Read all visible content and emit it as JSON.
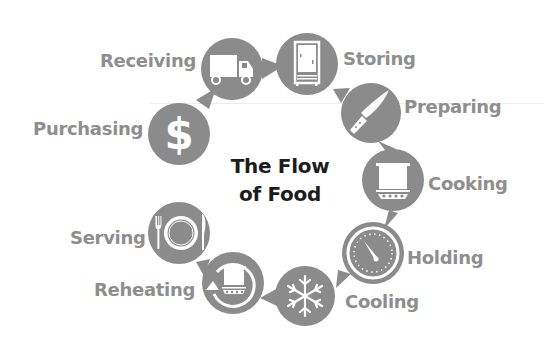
{
  "title": {
    "line1": "The Flow",
    "line2": "of Food"
  },
  "colors": {
    "circle": "#8b8b8b",
    "icon": "#ffffff",
    "label": "#8e8e8e",
    "title": "#1c1c1c"
  },
  "steps": [
    {
      "label": "Purchasing",
      "icon": "dollar-icon"
    },
    {
      "label": "Receiving",
      "icon": "truck-icon"
    },
    {
      "label": "Storing",
      "icon": "refrigerator-icon"
    },
    {
      "label": "Preparing",
      "icon": "knife-icon"
    },
    {
      "label": "Cooking",
      "icon": "cooking-pot-icon"
    },
    {
      "label": "Holding",
      "icon": "thermometer-dial-icon"
    },
    {
      "label": "Cooling",
      "icon": "snowflake-icon"
    },
    {
      "label": "Reheating",
      "icon": "reheat-pot-icon"
    },
    {
      "label": "Serving",
      "icon": "plate-fork-knife-icon"
    }
  ]
}
